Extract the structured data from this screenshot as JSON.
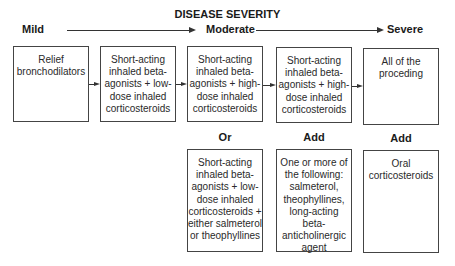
{
  "diagram": {
    "title": "DISEASE SEVERITY",
    "severity_scale": {
      "mild": "Mild",
      "moderate": "Moderate",
      "severe": "Severe"
    },
    "steps": [
      {
        "text": "Relief bronchodilators"
      },
      {
        "text": "Short-acting inhaled beta-agonists + low-dose inhaled corticosteroids"
      },
      {
        "text": "Short-acting inhaled beta-agonists + high-dose inhaled corticosteroids"
      },
      {
        "text": "Short-acting inhaled beta-agonists + high-dose inhaled corticosteroids"
      },
      {
        "text": "All of the proceding"
      }
    ],
    "alternatives": [
      {
        "label": "Or",
        "text": "Short-acting inhaled beta-agonists + low-dose inhaled corticosteroids + either salmeterol or theophyllines"
      },
      {
        "label": "Add",
        "text": "One or more of the following: salmeterol, theophyllines, long-acting beta-anticholinergic agent"
      },
      {
        "label": "Add",
        "text": "Oral corticosteroids"
      }
    ],
    "colors": {
      "line": "#333333",
      "border": "#444444",
      "text": "#222222"
    }
  }
}
